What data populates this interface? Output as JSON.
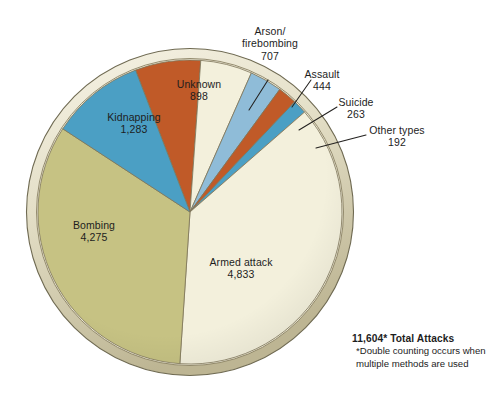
{
  "chart_data": {
    "type": "pie",
    "title": "",
    "total_label": "11,604* Total Attacks",
    "footnote": "*Double counting occurs when multiple methods are used",
    "total_value": 11604,
    "units": "attacks",
    "legend": "none",
    "categories": [
      "Armed attack",
      "Bombing",
      "Kidnapping",
      "Unknown",
      "Arson/\nfirebombing",
      "Assault",
      "Suicide",
      "Other types"
    ],
    "values": [
      4833,
      4275,
      1283,
      898,
      707,
      444,
      263,
      192
    ],
    "slices": [
      {
        "id": "unknown",
        "label": "Unknown",
        "value": "898",
        "number": 898,
        "color": "#c05a28",
        "label_placement": "inside",
        "label_x": 168,
        "label_y": 80
      },
      {
        "id": "arson",
        "label": "Arson/\nfirebombing",
        "value": "707",
        "number": 707,
        "color": "#f3f0dc",
        "label_placement": "callout",
        "label_x": 235,
        "label_y": 16
      },
      {
        "id": "assault",
        "label": "Assault",
        "value": "444",
        "number": 444,
        "color": "#8fbcd8",
        "label_placement": "callout",
        "label_x": 300,
        "label_y": 57
      },
      {
        "id": "suicide",
        "label": "Suicide",
        "value": "263",
        "number": 263,
        "color": "#c05a28",
        "label_placement": "callout",
        "label_x": 333,
        "label_y": 85
      },
      {
        "id": "other",
        "label": "Other types",
        "value": "192",
        "number": 192,
        "color": "#4b9fc4",
        "label_placement": "callout",
        "label_x": 365,
        "label_y": 113
      },
      {
        "id": "armed",
        "label": "Armed attack",
        "value": "4,833",
        "number": 4833,
        "color": "#f3f0dc",
        "label_placement": "inside",
        "label_x": 200,
        "label_y": 256
      },
      {
        "id": "bombing",
        "label": "Bombing",
        "value": "4,275",
        "number": 4275,
        "color": "#c6c283",
        "label_placement": "inside",
        "label_x": 61,
        "label_y": 219
      },
      {
        "id": "kidnapping",
        "label": "Kidnapping",
        "value": "1,283",
        "number": 1283,
        "color": "#4b9fc4",
        "label_placement": "inside",
        "label_x": 102,
        "label_y": 112
      }
    ],
    "colors": {
      "cream": "#f3f0dc",
      "olive": "#c6c283",
      "blue": "#4b9fc4",
      "light_blue": "#8fbcd8",
      "rust": "#c05a28",
      "rim_outer": "#cfc9ab",
      "rim_inner": "#efece0",
      "rim_stroke": "#8a8163",
      "background": "#ffffff",
      "text": "#1d1d1d",
      "leader_line": "#23211f"
    },
    "geometry": {
      "cx": 190,
      "cy": 212,
      "r": 152,
      "rim_r": 164
    }
  }
}
